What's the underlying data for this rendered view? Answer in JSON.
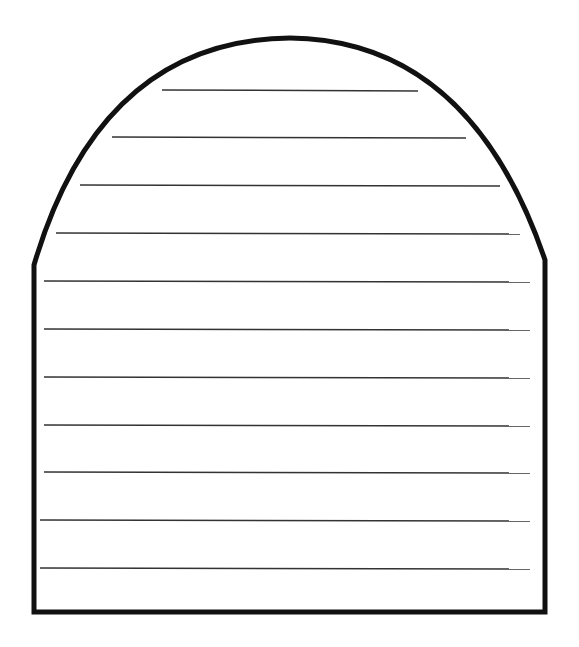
{
  "template": {
    "shape": "arch-top-lined-paper",
    "outline_color": "#111111",
    "line_color": "#333333",
    "lines": [
      {
        "y": 90,
        "x1": 162,
        "x2": 418
      },
      {
        "y": 137,
        "x1": 112,
        "x2": 466
      },
      {
        "y": 185,
        "x1": 80,
        "x2": 500
      },
      {
        "y": 233,
        "x1": 56,
        "x2": 520
      },
      {
        "y": 281,
        "x1": 44,
        "x2": 530
      },
      {
        "y": 329,
        "x1": 44,
        "x2": 530
      },
      {
        "y": 377,
        "x1": 44,
        "x2": 530
      },
      {
        "y": 425,
        "x1": 44,
        "x2": 530
      },
      {
        "y": 472,
        "x1": 44,
        "x2": 530
      },
      {
        "y": 520,
        "x1": 40,
        "x2": 530
      },
      {
        "y": 568,
        "x1": 40,
        "x2": 530
      }
    ]
  }
}
